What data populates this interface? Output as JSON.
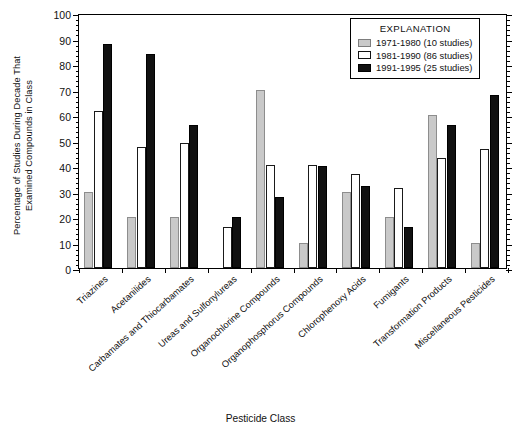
{
  "chart_data": {
    "type": "bar",
    "title": "",
    "xlabel": "Pesticide Class",
    "ylabel": "Percentage of Studies During Decade That Examined Compounds in Class",
    "ylabel_line1": "Percentage of Studies During Decade That",
    "ylabel_line2": "Examined Compounds in Class",
    "ylim": [
      0,
      100
    ],
    "ytick_step": 10,
    "yminor_step": 2,
    "ytick_labels": [
      "100",
      "90",
      "80",
      "70",
      "60",
      "50",
      "40",
      "30",
      "20",
      "10",
      "0"
    ],
    "grid": false,
    "legend_position": "top-right",
    "legend_title": "EXPLANATION",
    "categories": [
      "Triazines",
      "Acetanilides",
      "Carbamates and Thiocarbamates",
      "Ureas and Sulfonylureas",
      "Organochlorine Compounds",
      "Organophosphorus Compounds",
      "Chlorophenoxy Acids",
      "Fumigants",
      "Transformation Products",
      "Miscellaneous Pesticides"
    ],
    "series": [
      {
        "name": "1971-1980 (10 studies)",
        "period": "1971-1980",
        "studies": 10,
        "color": "#c9c9c9",
        "values": [
          30,
          20,
          20,
          0,
          70,
          10,
          30,
          20,
          60,
          10
        ]
      },
      {
        "name": "1981-1990 (86 studies)",
        "period": "1981-1990",
        "studies": 86,
        "color": "#ffffff",
        "values": [
          61.5,
          47.5,
          49,
          16,
          40.5,
          40.5,
          37,
          31.5,
          43,
          46.5
        ]
      },
      {
        "name": "1991-1995 (25 studies)",
        "period": "1991-1995",
        "studies": 25,
        "color": "#111111",
        "values": [
          88,
          84,
          56,
          20,
          28,
          40,
          32,
          16,
          56,
          68
        ]
      }
    ]
  }
}
